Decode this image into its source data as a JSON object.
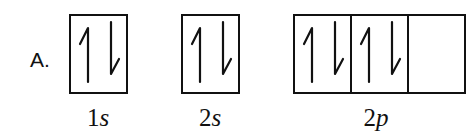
{
  "option": {
    "label": "A."
  },
  "orbitals": [
    {
      "sublevel": "1s",
      "number": "1",
      "letter": "s",
      "boxes": [
        {
          "electrons": [
            "up",
            "down"
          ]
        }
      ]
    },
    {
      "sublevel": "2s",
      "number": "2",
      "letter": "s",
      "boxes": [
        {
          "electrons": [
            "up",
            "down"
          ]
        }
      ]
    },
    {
      "sublevel": "2p",
      "number": "2",
      "letter": "p",
      "boxes": [
        {
          "electrons": [
            "up",
            "down"
          ]
        },
        {
          "electrons": [
            "up",
            "down"
          ]
        },
        {
          "electrons": []
        }
      ]
    }
  ],
  "colors": {
    "stroke": "#111111",
    "background": "#ffffff"
  }
}
